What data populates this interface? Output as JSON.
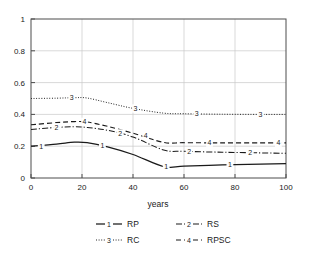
{
  "chart_data": {
    "type": "line",
    "title": "",
    "xlabel": "years",
    "ylabel": "",
    "xlim": [
      0,
      100
    ],
    "ylim": [
      0,
      1
    ],
    "grid": true,
    "legend_position": "bottom",
    "xticks": [
      "0",
      "20",
      "40",
      "60",
      "80",
      "100"
    ],
    "yticks": [
      "0",
      "0.2",
      "0.4",
      "0.6",
      "0.8",
      "1"
    ],
    "xtick_values": [
      0,
      20,
      40,
      60,
      80,
      100
    ],
    "ytick_values": [
      0,
      0.2,
      0.4,
      0.6,
      0.8,
      1
    ],
    "series": [
      {
        "id": "1",
        "name": "RP",
        "style": "solid",
        "marker_label": "1",
        "x": [
          0,
          10,
          17,
          22,
          30,
          40,
          52,
          60,
          75,
          90,
          100
        ],
        "values": [
          0.2,
          0.213,
          0.225,
          0.222,
          0.196,
          0.148,
          0.072,
          0.074,
          0.082,
          0.088,
          0.09
        ]
      },
      {
        "id": "2",
        "name": "RS",
        "style": "dash-dot",
        "marker_label": "2",
        "x": [
          0,
          10,
          17,
          22,
          30,
          40,
          52,
          60,
          75,
          90,
          100
        ],
        "values": [
          0.305,
          0.318,
          0.322,
          0.318,
          0.3,
          0.258,
          0.176,
          0.168,
          0.162,
          0.158,
          0.155
        ]
      },
      {
        "id": "3",
        "name": "RC",
        "style": "dotted",
        "marker_label": "3",
        "x": [
          0,
          10,
          17,
          22,
          30,
          40,
          52,
          60,
          75,
          90,
          100
        ],
        "values": [
          0.5,
          0.502,
          0.505,
          0.503,
          0.474,
          0.438,
          0.408,
          0.404,
          0.401,
          0.4,
          0.4
        ]
      },
      {
        "id": "4",
        "name": "RPSC",
        "style": "dashed",
        "marker_label": "4",
        "x": [
          0,
          10,
          17,
          22,
          30,
          40,
          52,
          60,
          75,
          90,
          100
        ],
        "values": [
          0.335,
          0.348,
          0.355,
          0.352,
          0.325,
          0.282,
          0.224,
          0.222,
          0.221,
          0.221,
          0.221
        ]
      }
    ],
    "inline_markers": [
      {
        "series": "1",
        "label": "1",
        "x": 4,
        "y": 0.2
      },
      {
        "series": "1",
        "label": "1",
        "x": 28,
        "y": 0.203
      },
      {
        "series": "1",
        "label": "1",
        "x": 53,
        "y": 0.073
      },
      {
        "series": "1",
        "label": "1",
        "x": 78,
        "y": 0.085
      },
      {
        "series": "2",
        "label": "2",
        "x": 10,
        "y": 0.318
      },
      {
        "series": "2",
        "label": "2",
        "x": 35,
        "y": 0.28
      },
      {
        "series": "2",
        "label": "2",
        "x": 62,
        "y": 0.168
      },
      {
        "series": "2",
        "label": "2",
        "x": 86,
        "y": 0.158
      },
      {
        "series": "3",
        "label": "3",
        "x": 16,
        "y": 0.505
      },
      {
        "series": "3",
        "label": "3",
        "x": 41,
        "y": 0.437
      },
      {
        "series": "3",
        "label": "3",
        "x": 65,
        "y": 0.404
      },
      {
        "series": "3",
        "label": "3",
        "x": 90,
        "y": 0.4
      },
      {
        "series": "4",
        "label": "4",
        "x": 21,
        "y": 0.353
      },
      {
        "series": "4",
        "label": "4",
        "x": 45,
        "y": 0.265
      },
      {
        "series": "4",
        "label": "4",
        "x": 70,
        "y": 0.222
      },
      {
        "series": "4",
        "label": "4",
        "x": 97,
        "y": 0.221
      }
    ]
  },
  "legend": {
    "entries": [
      {
        "marker": "1",
        "label": "RP",
        "style": "solid"
      },
      {
        "marker": "2",
        "label": "RS",
        "style": "dash-dot"
      },
      {
        "marker": "3",
        "label": "RC",
        "style": "dotted"
      },
      {
        "marker": "4",
        "label": "RPSC",
        "style": "dashed"
      }
    ]
  },
  "colors": {
    "line": "#1a1a1a",
    "grid": "#c8c8c8",
    "frame": "#4d4d4d",
    "background": "#ffffff"
  }
}
